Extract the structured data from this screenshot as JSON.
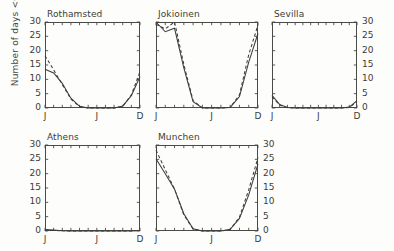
{
  "figure": {
    "ylabel": "Number of days <0°C",
    "yticks": [
      0,
      5,
      10,
      15,
      20,
      25,
      30
    ],
    "ytick_labels": [
      "0",
      "5",
      "10",
      "15",
      "20",
      "25",
      "30"
    ],
    "xtick_labels": [
      "J",
      "J",
      "D"
    ],
    "line_color": "#3d3d39",
    "frame_color": "#4a4a46"
  },
  "chart_data": [
    {
      "type": "line",
      "title": "Rothamsted",
      "xlabel": "",
      "ylabel": "Number of days <0°C",
      "xlim": [
        0,
        11
      ],
      "ylim": [
        0,
        30
      ],
      "x": [
        0,
        1,
        2,
        3,
        4,
        5,
        6,
        7,
        8,
        9,
        10,
        11
      ],
      "xtick_positions": [
        0,
        6,
        11
      ],
      "xtick_labels": [
        "J",
        "J",
        "D"
      ],
      "yticks": [
        0,
        5,
        10,
        15,
        20,
        25,
        30
      ],
      "grid": false,
      "legend": "none",
      "series": [
        {
          "name": "observed",
          "style": "solid",
          "values": [
            13.5,
            12.2,
            8.6,
            3.4,
            0.6,
            0.0,
            0.0,
            0.0,
            0.0,
            0.7,
            4.3,
            11.0
          ]
        },
        {
          "name": "modelled",
          "style": "dashed",
          "values": [
            18.2,
            13.3,
            8.2,
            3.1,
            0.5,
            0.0,
            0.0,
            0.0,
            0.0,
            0.6,
            4.6,
            12.6
          ]
        }
      ]
    },
    {
      "type": "line",
      "title": "Jokioinen",
      "xlabel": "",
      "ylabel": "",
      "xlim": [
        0,
        11
      ],
      "ylim": [
        0,
        30
      ],
      "x": [
        0,
        1,
        2,
        3,
        4,
        5,
        6,
        7,
        8,
        9,
        10,
        11
      ],
      "xtick_positions": [
        0,
        6,
        11
      ],
      "xtick_labels": [
        "J",
        "J",
        "D"
      ],
      "yticks": [
        0,
        5,
        10,
        15,
        20,
        25,
        30
      ],
      "grid": false,
      "legend": "none",
      "series": [
        {
          "name": "observed",
          "style": "solid",
          "values": [
            30.0,
            26.6,
            27.8,
            14.0,
            2.2,
            0.0,
            0.0,
            0.0,
            0.2,
            4.0,
            16.0,
            26.0
          ]
        },
        {
          "name": "modelled",
          "style": "dashed",
          "values": [
            29.2,
            27.6,
            30.0,
            15.2,
            2.6,
            0.0,
            0.0,
            0.0,
            0.2,
            4.6,
            18.6,
            29.0
          ]
        }
      ]
    },
    {
      "type": "line",
      "title": "Sevilla",
      "xlabel": "",
      "ylabel": "",
      "xlim": [
        0,
        11
      ],
      "ylim": [
        0,
        30
      ],
      "x": [
        0,
        1,
        2,
        3,
        4,
        5,
        6,
        7,
        8,
        9,
        10,
        11
      ],
      "xtick_positions": [
        0,
        6,
        11
      ],
      "xtick_labels": [
        "J",
        "J",
        "D"
      ],
      "yticks": [
        0,
        5,
        10,
        15,
        20,
        25,
        30
      ],
      "grid": false,
      "legend": "none",
      "series": [
        {
          "name": "observed",
          "style": "solid",
          "values": [
            4.4,
            1.2,
            0.2,
            0.0,
            0.0,
            0.0,
            0.0,
            0.0,
            0.0,
            0.0,
            0.3,
            2.6
          ]
        },
        {
          "name": "modelled",
          "style": "dashed",
          "values": [
            4.0,
            1.0,
            0.1,
            0.0,
            0.0,
            0.0,
            0.0,
            0.0,
            0.0,
            0.0,
            0.2,
            2.2
          ]
        }
      ]
    },
    {
      "type": "line",
      "title": "Athens",
      "xlabel": "",
      "ylabel": "Number of days <0°C",
      "xlim": [
        0,
        11
      ],
      "ylim": [
        0,
        30
      ],
      "x": [
        0,
        1,
        2,
        3,
        4,
        5,
        6,
        7,
        8,
        9,
        10,
        11
      ],
      "xtick_positions": [
        0,
        6,
        11
      ],
      "xtick_labels": [
        "J",
        "J",
        "D"
      ],
      "yticks": [
        0,
        5,
        10,
        15,
        20,
        25,
        30
      ],
      "grid": false,
      "legend": "none",
      "series": [
        {
          "name": "observed",
          "style": "solid",
          "values": [
            0.5,
            0.3,
            0.1,
            0.0,
            0.0,
            0.0,
            0.0,
            0.0,
            0.0,
            0.0,
            0.0,
            0.2
          ]
        },
        {
          "name": "modelled",
          "style": "dashed",
          "values": [
            0.4,
            0.2,
            0.1,
            0.0,
            0.0,
            0.0,
            0.0,
            0.0,
            0.0,
            0.0,
            0.0,
            0.2
          ]
        }
      ]
    },
    {
      "type": "line",
      "title": "Munchen",
      "xlabel": "",
      "ylabel": "",
      "xlim": [
        0,
        11
      ],
      "ylim": [
        0,
        30
      ],
      "x": [
        0,
        1,
        2,
        3,
        4,
        5,
        6,
        7,
        8,
        9,
        10,
        11
      ],
      "xtick_positions": [
        0,
        6,
        11
      ],
      "xtick_labels": [
        "J",
        "J",
        "D"
      ],
      "yticks": [
        0,
        5,
        10,
        15,
        20,
        25,
        30
      ],
      "grid": false,
      "legend": "none",
      "series": [
        {
          "name": "observed",
          "style": "solid",
          "values": [
            25.2,
            20.0,
            14.6,
            6.0,
            0.8,
            0.0,
            0.0,
            0.0,
            0.6,
            4.4,
            12.6,
            23.4
          ]
        },
        {
          "name": "modelled",
          "style": "dashed",
          "values": [
            28.2,
            21.4,
            14.6,
            5.6,
            0.7,
            0.0,
            0.0,
            0.0,
            0.5,
            4.8,
            14.4,
            25.6
          ]
        }
      ]
    }
  ],
  "panels": [
    {
      "key": "rothamsted",
      "title": "Rothamsted",
      "x": 45,
      "y": 22,
      "w": 95,
      "h": 86,
      "yaxis": "left",
      "xaxis": true
    },
    {
      "key": "jokioinen",
      "title": "Jokioinen",
      "x": 156,
      "y": 22,
      "w": 102,
      "h": 86,
      "yaxis": "none",
      "xaxis": true
    },
    {
      "key": "sevilla",
      "title": "Sevilla",
      "x": 272,
      "y": 22,
      "w": 85,
      "h": 86,
      "yaxis": "right",
      "xaxis": true
    },
    {
      "key": "athens",
      "title": "Athens",
      "x": 45,
      "y": 145,
      "w": 95,
      "h": 86,
      "yaxis": "left",
      "xaxis": true
    },
    {
      "key": "munchen",
      "title": "Munchen",
      "x": 156,
      "y": 145,
      "w": 102,
      "h": 86,
      "yaxis": "right",
      "xaxis": true
    }
  ]
}
